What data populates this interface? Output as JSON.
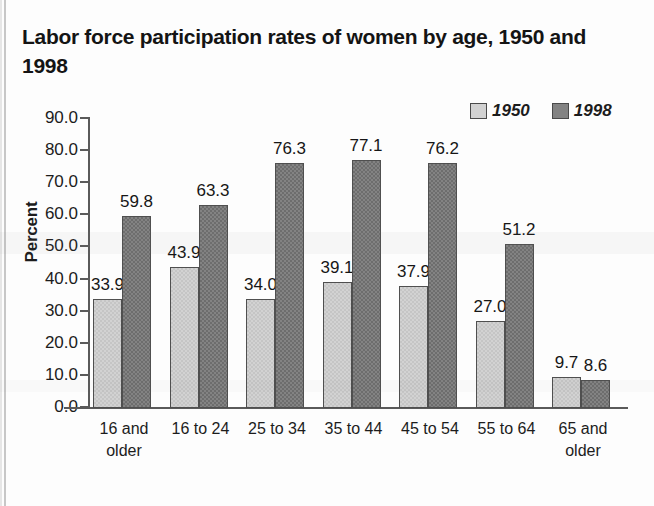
{
  "chart_title": "Labor force participation rates of women by age, 1950 and 1998",
  "legend": {
    "position": "top-right",
    "items": [
      {
        "label": "1950",
        "color": "#d2d2d2"
      },
      {
        "label": "1998",
        "color": "#838383"
      }
    ]
  },
  "axes": {
    "ylabel": "Percent",
    "ytick_labels": [
      "90.0",
      "80.0",
      "70.0",
      "60.0",
      "50.0",
      "40.0",
      "30.0",
      "20.0",
      "10.0",
      "0.0"
    ]
  },
  "chart_data": {
    "type": "bar",
    "title": "Labor force participation rates of women by age, 1950 and 1998",
    "xlabel": "",
    "ylabel": "Percent",
    "ylim": [
      0,
      90
    ],
    "ytick_step": 10,
    "grid": false,
    "legend_position": "top-right",
    "categories": [
      "16 and older",
      "16 to 24",
      "25 to 34",
      "35 to 44",
      "45 to 54",
      "55 to 64",
      "65 and older"
    ],
    "series": [
      {
        "name": "1950",
        "color": "#d2d2d2",
        "values": [
          33.9,
          43.9,
          34.0,
          39.1,
          37.9,
          27.0,
          9.7
        ],
        "labels": [
          "33.9",
          "43.9",
          "34.0",
          "39.1",
          "37.9",
          "27.0",
          "9.7"
        ]
      },
      {
        "name": "1998",
        "color": "#838383",
        "values": [
          59.8,
          63.3,
          76.3,
          77.1,
          76.2,
          51.2,
          8.6
        ],
        "labels": [
          "59.8",
          "63.3",
          "76.3",
          "77.1",
          "76.2",
          "51.2",
          "8.6"
        ]
      }
    ]
  }
}
